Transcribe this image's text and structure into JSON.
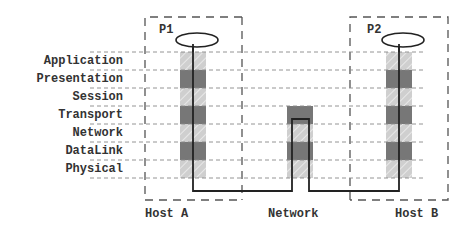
{
  "layers": [
    {
      "label": "Application",
      "shade": "light"
    },
    {
      "label": "Presentation",
      "shade": "dark"
    },
    {
      "label": "Session",
      "shade": "light"
    },
    {
      "label": "Transport",
      "shade": "dark"
    },
    {
      "label": "Network",
      "shade": "light"
    },
    {
      "label": "DataLink",
      "shade": "dark"
    },
    {
      "label": "Physical",
      "shade": "light"
    }
  ],
  "hosts": {
    "host_a": {
      "label": "Host A",
      "process": "P1"
    },
    "network": {
      "label": "Network"
    },
    "host_b": {
      "label": "Host B",
      "process": "P2"
    }
  },
  "colors": {
    "dark_layer": "#777777",
    "light_layer": "#cfcfcf",
    "line": "#222222",
    "dashed": "#555555",
    "row_dash": "#888888"
  }
}
